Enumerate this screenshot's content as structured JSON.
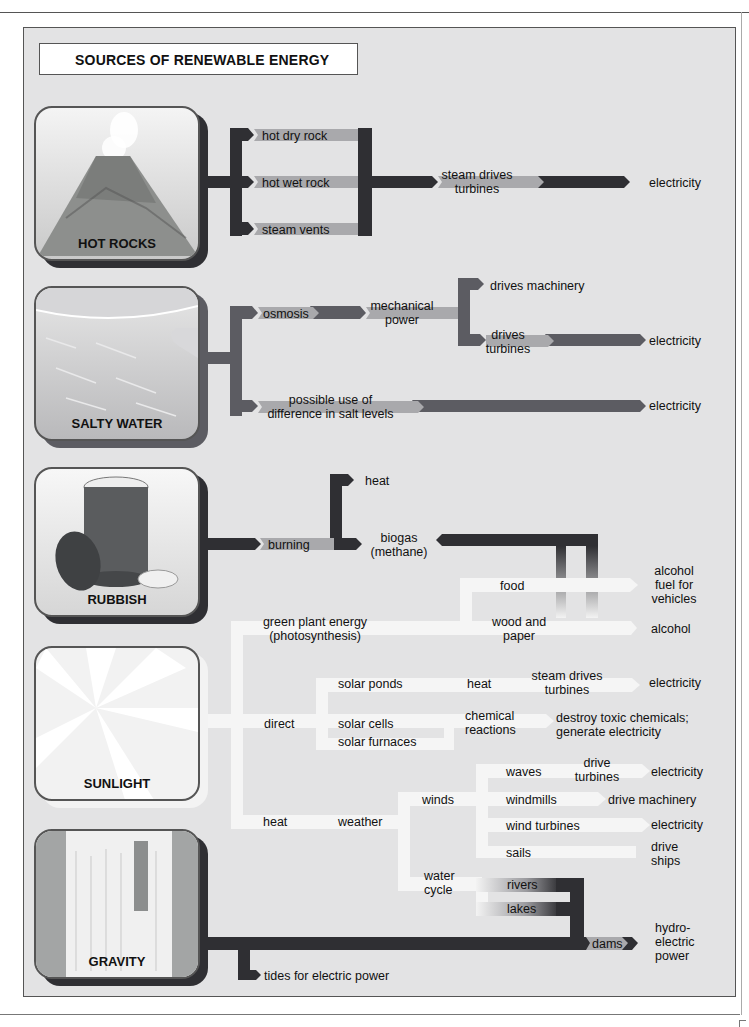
{
  "title": "SOURCES OF RENEWABLE ENERGY",
  "colors": {
    "panel_bg": "#e3e3e4",
    "dark_flow": "#2f2f33",
    "mid_flow": "#5c5c62",
    "light_flow": "#a9a9ac",
    "sunlight_flow": "#f3f3f3"
  },
  "sources": [
    {
      "id": "hot_rocks",
      "label": "HOT ROCKS",
      "icon": "volcano-icon"
    },
    {
      "id": "salty_water",
      "label": "SALTY WATER",
      "icon": "sea-water-icon"
    },
    {
      "id": "rubbish",
      "label": "RUBBISH",
      "icon": "dustbin-icon"
    },
    {
      "id": "sunlight",
      "label": "SUNLIGHT",
      "icon": "sun-rays-icon"
    },
    {
      "id": "gravity",
      "label": "GRAVITY",
      "icon": "waterfall-icon"
    }
  ],
  "hot_rocks": {
    "hot_dry_rock": "hot dry rock",
    "hot_wet_rock": "hot wet rock",
    "steam_vents": "steam vents",
    "steam_drives_1": "steam drives",
    "steam_drives_2": "turbines",
    "electricity": "electricity"
  },
  "salty_water": {
    "osmosis": "osmosis",
    "mechanical_1": "mechanical",
    "mechanical_2": "power",
    "drives_machinery": "drives machinery",
    "drives_turbines_1": "drives",
    "drives_turbines_2": "turbines",
    "electricity_1": "electricity",
    "possible_1": "possible use of",
    "possible_2": "difference in salt levels",
    "electricity_2": "electricity"
  },
  "rubbish": {
    "heat": "heat",
    "burning": "burning",
    "biogas_1": "biogas",
    "biogas_2": "(methane)"
  },
  "sunlight": {
    "food": "food",
    "alcohol_fuel_1": "alcohol",
    "alcohol_fuel_2": "fuel for",
    "alcohol_fuel_3": "vehicles",
    "green_plant_1": "green plant energy",
    "green_plant_2": "(photosynthesis)",
    "wood_paper_1": "wood and",
    "wood_paper_2": "paper",
    "alcohol": "alcohol",
    "solar_ponds": "solar ponds",
    "heat_ponds": "heat",
    "steam_drives_1": "steam drives",
    "steam_drives_2": "turbines",
    "electricity_ponds": "electricity",
    "direct": "direct",
    "solar_cells": "solar cells",
    "solar_furnaces": "solar furnaces",
    "chemical_1": "chemical",
    "chemical_2": "reactions",
    "destroy_1": "destroy toxic chemicals;",
    "destroy_2": "generate electricity",
    "heat": "heat",
    "weather": "weather",
    "winds": "winds",
    "waves": "waves",
    "drive_turbines_1": "drive",
    "drive_turbines_2": "turbines",
    "electricity_waves": "electricity",
    "windmills": "windmills",
    "drive_machinery": "drive machinery",
    "wind_turbines": "wind turbines",
    "electricity_wind": "electricity",
    "sails": "sails",
    "drive_ships_1": "drive",
    "drive_ships_2": "ships",
    "water_cycle_1": "water",
    "water_cycle_2": "cycle",
    "rivers": "rivers",
    "lakes": "lakes"
  },
  "gravity": {
    "dams": "dams",
    "hydro_1": "hydro-",
    "hydro_2": "electric",
    "hydro_3": "power",
    "tides": "tides for electric power"
  }
}
